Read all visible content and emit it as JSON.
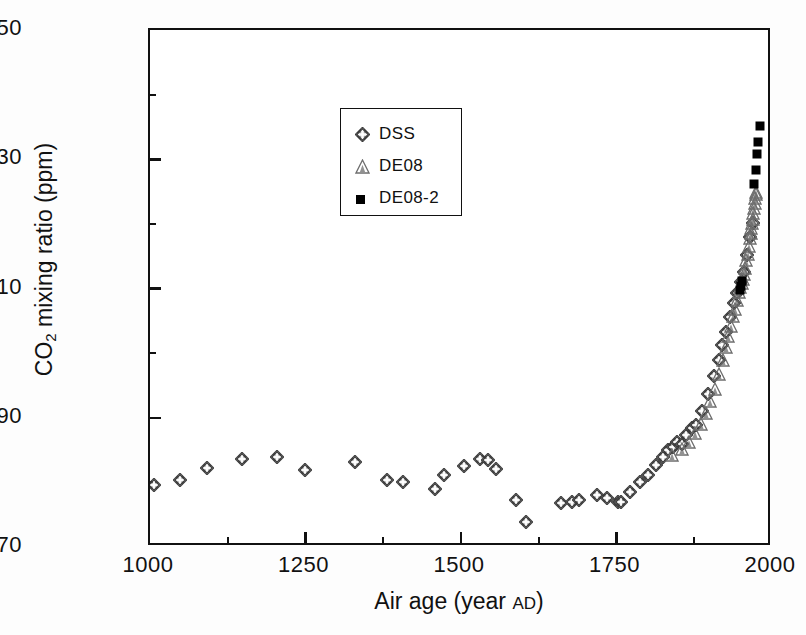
{
  "chart_data": {
    "type": "scatter",
    "title": "",
    "xlabel": "Air age (year AD)",
    "ylabel": "CO2 mixing ratio (ppm)",
    "ylabel_parts": {
      "prefix": "CO",
      "sub": "2",
      "suffix": " mixing ratio (ppm)"
    },
    "xlabel_parts": {
      "prefix": "Air age (year ",
      "smallcaps": "AD",
      "suffix": ")"
    },
    "xlim": [
      1000,
      2000
    ],
    "ylim": [
      270,
      350
    ],
    "x_ticks": [
      1000,
      1250,
      1500,
      1750,
      2000
    ],
    "x_tick_labels": [
      "1000",
      "1250",
      "1500",
      "1750",
      "2000"
    ],
    "x_minor_ticks": [
      1125,
      1375,
      1625,
      1875
    ],
    "y_ticks": [
      270,
      290,
      310,
      330,
      350
    ],
    "y_tick_labels": [
      "270",
      "290",
      "310",
      "330",
      "350"
    ],
    "y_minor_ticks": [
      280,
      300,
      320,
      340
    ],
    "grid": false,
    "tick_direction": "in",
    "frame": "box",
    "legend_position": "upper-left-inside",
    "series": [
      {
        "name": "DSS",
        "marker": "diamond-cross",
        "color": "#3a3a3a",
        "points": [
          [
            1006,
            279.6
          ],
          [
            1048,
            280.4
          ],
          [
            1092,
            282.3
          ],
          [
            1148,
            283.6
          ],
          [
            1204,
            284.0
          ],
          [
            1249,
            281.9
          ],
          [
            1330,
            283.2
          ],
          [
            1381,
            280.4
          ],
          [
            1406,
            280.1
          ],
          [
            1459,
            278.9
          ],
          [
            1472,
            281.1
          ],
          [
            1505,
            282.6
          ],
          [
            1530,
            283.6
          ],
          [
            1543,
            283.4
          ],
          [
            1556,
            282.0
          ],
          [
            1589,
            277.2
          ],
          [
            1604,
            273.8
          ],
          [
            1661,
            276.8
          ],
          [
            1678,
            276.9
          ],
          [
            1690,
            277.3
          ],
          [
            1718,
            278.1
          ],
          [
            1734,
            277.6
          ],
          [
            1752,
            276.9
          ],
          [
            1757,
            277.0
          ],
          [
            1771,
            278.5
          ],
          [
            1788,
            280.1
          ],
          [
            1800,
            281.2
          ],
          [
            1813,
            282.7
          ],
          [
            1824,
            284.0
          ],
          [
            1833,
            285.0
          ],
          [
            1841,
            285.5
          ],
          [
            1847,
            286.2
          ],
          [
            1856,
            286.0
          ],
          [
            1862,
            287.4
          ],
          [
            1872,
            288.4
          ],
          [
            1878,
            288.9
          ],
          [
            1888,
            291.0
          ],
          [
            1897,
            293.6
          ],
          [
            1906,
            296.5
          ],
          [
            1914,
            299.0
          ],
          [
            1920,
            301.3
          ],
          [
            1926,
            303.2
          ],
          [
            1933,
            305.6
          ],
          [
            1939,
            307.8
          ],
          [
            1944,
            309.3
          ],
          [
            1950,
            311.0
          ],
          [
            1955,
            312.6
          ],
          [
            1960,
            315.2
          ],
          [
            1965,
            318.0
          ],
          [
            1969,
            320.2
          ]
        ]
      },
      {
        "name": "DE08",
        "marker": "triangle",
        "color": "#6e6e6e",
        "points": [
          [
            1840,
            284.3
          ],
          [
            1855,
            285.1
          ],
          [
            1866,
            286.2
          ],
          [
            1877,
            287.6
          ],
          [
            1886,
            289.0
          ],
          [
            1894,
            290.8
          ],
          [
            1901,
            292.6
          ],
          [
            1908,
            294.4
          ],
          [
            1915,
            296.7
          ],
          [
            1921,
            299.0
          ],
          [
            1926,
            301.0
          ],
          [
            1930,
            302.6
          ],
          [
            1934,
            304.2
          ],
          [
            1938,
            305.8
          ],
          [
            1941,
            306.8
          ],
          [
            1944,
            308.2
          ],
          [
            1947,
            309.4
          ],
          [
            1949,
            310.2
          ],
          [
            1951,
            310.9
          ],
          [
            1953,
            311.5
          ],
          [
            1955,
            312.2
          ],
          [
            1957,
            313.2
          ],
          [
            1959,
            314.4
          ],
          [
            1961,
            315.4
          ],
          [
            1963,
            316.6
          ],
          [
            1965,
            317.8
          ],
          [
            1966,
            318.6
          ],
          [
            1967,
            319.4
          ],
          [
            1968,
            320.1
          ],
          [
            1969,
            320.8
          ],
          [
            1970,
            321.7
          ],
          [
            1971,
            322.4
          ],
          [
            1972,
            323.2
          ],
          [
            1973,
            324.0
          ],
          [
            1974,
            324.6
          ],
          [
            1975,
            325.0
          ]
        ]
      },
      {
        "name": "DE08-2",
        "marker": "filled-square",
        "color": "#000000",
        "points": [
          [
            1948,
            309.8
          ],
          [
            1950,
            310.4
          ],
          [
            1952,
            311.2
          ],
          [
            1971,
            326.2
          ],
          [
            1974,
            328.4
          ],
          [
            1976,
            330.8
          ],
          [
            1978,
            332.6
          ],
          [
            1980,
            335.2
          ]
        ]
      }
    ]
  },
  "legend": {
    "items": [
      {
        "label": "DSS",
        "marker": "diamond-cross"
      },
      {
        "label": "DE08",
        "marker": "triangle"
      },
      {
        "label": "DE08-2",
        "marker": "filled-square"
      }
    ]
  }
}
